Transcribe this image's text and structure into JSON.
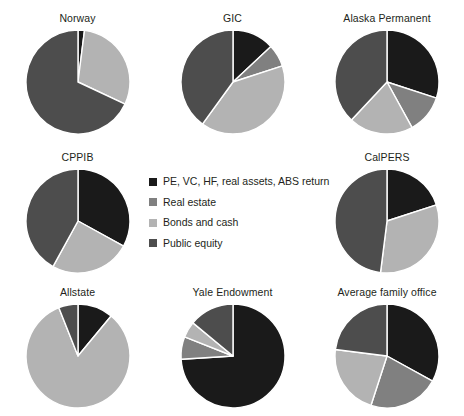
{
  "colors": {
    "alternatives": "#1a1a1a",
    "real_estate": "#808080",
    "bonds_cash": "#b3b3b3",
    "public_equity": "#4d4d4d",
    "background": "#ffffff",
    "separator": "#ffffff",
    "text": "#231f20"
  },
  "legend": {
    "items": [
      {
        "label": "PE, VC, HF, real assets, ABS return",
        "color": "#1a1a1a",
        "key": "alternatives"
      },
      {
        "label": "Real estate",
        "color": "#808080",
        "key": "real_estate"
      },
      {
        "label": "Bonds and cash",
        "color": "#b3b3b3",
        "key": "bonds_cash"
      },
      {
        "label": "Public equity",
        "color": "#4d4d4d",
        "key": "public_equity"
      }
    ]
  },
  "chart_data": {
    "type": "pie",
    "title": "",
    "legend_position": "center",
    "categories": [
      "PE, VC, HF, real assets, ABS return",
      "Real estate",
      "Bonds and cash",
      "Public equity"
    ],
    "category_colors": [
      "#1a1a1a",
      "#808080",
      "#b3b3b3",
      "#4d4d4d"
    ],
    "units": "percent",
    "charts": [
      {
        "title": "Norway",
        "radius": 52,
        "values": [
          2,
          0,
          30,
          68
        ]
      },
      {
        "title": "GIC",
        "radius": 52,
        "values": [
          13,
          7,
          40,
          40
        ]
      },
      {
        "title": "Alaska Permanent",
        "radius": 52,
        "values": [
          30,
          12,
          20,
          38
        ]
      },
      {
        "title": "CPPIB",
        "radius": 52,
        "values": [
          33,
          0,
          25,
          42
        ]
      },
      {
        "title": "CalPERS",
        "radius": 52,
        "values": [
          20,
          0,
          32,
          48
        ]
      },
      {
        "title": "Allstate",
        "radius": 52,
        "values": [
          11,
          0,
          83,
          6
        ]
      },
      {
        "title": "Yale Endowment",
        "radius": 52,
        "values": [
          74,
          7,
          5,
          14
        ]
      },
      {
        "title": "Average family office",
        "radius": 52,
        "values": [
          33,
          22,
          22,
          23
        ]
      }
    ]
  },
  "layout": {
    "grid_order": [
      0,
      1,
      2,
      3,
      "legend",
      4,
      5,
      6,
      7
    ]
  }
}
